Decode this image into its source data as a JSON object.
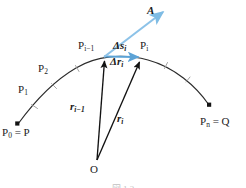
{
  "figure": {
    "type": "line-integral-partition-diagram",
    "background_color": "#ffffff",
    "curve_color": "#2b2b2b",
    "vector_color": "#111111",
    "accent_color": "#6CAEDC",
    "caption": "図 1.2"
  },
  "labels": {
    "vector_field": {
      "text": "A",
      "style": "bold-italic",
      "color": "#1c1c1c"
    },
    "p_start": {
      "text": "P",
      "subscript": "0",
      "equals": " = P"
    },
    "p_end": {
      "text": "P",
      "subscript": "n",
      "equals": " = Q"
    },
    "p_one": {
      "text": "P",
      "subscript": "1"
    },
    "p_two": {
      "text": "P",
      "subscript": "2"
    },
    "p_prev": {
      "text": "P",
      "subscript": "i−1"
    },
    "p_curr": {
      "text": "P",
      "subscript": "i"
    },
    "delta_s": {
      "text": "Δs",
      "subscript": "i",
      "color": "#1c1c1c"
    },
    "delta_r": {
      "text": "Δr",
      "subscript": "i",
      "color": "#1c1c1c"
    },
    "r_prev": {
      "text": "r",
      "subscript": "i−1"
    },
    "r_curr": {
      "text": "r",
      "subscript": "i"
    },
    "origin": {
      "text": "O"
    }
  },
  "geometry": {
    "origin_point": [
      97,
      161
    ],
    "p_prev_point": [
      104,
      56
    ],
    "p_curr_point": [
      141,
      57
    ],
    "p_start_point": [
      15,
      126
    ],
    "p_end_point": [
      212,
      108
    ]
  }
}
